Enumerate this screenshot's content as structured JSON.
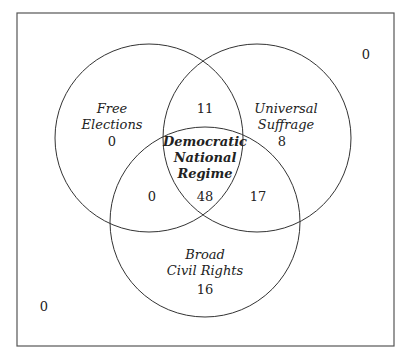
{
  "diagram": {
    "type": "venn",
    "sets": [
      {
        "name": "Free Elections",
        "only": "0"
      },
      {
        "name": "Universal Suffrage",
        "only": "8"
      },
      {
        "name": "Broad Civil Rights",
        "only": "16"
      }
    ],
    "labels": {
      "free_elections_1": "Free",
      "free_elections_2": "Elections",
      "universal_suffrage_1": "Universal",
      "universal_suffrage_2": "Suffrage",
      "broad_civil_rights_1": "Broad",
      "broad_civil_rights_2": "Civil Rights",
      "center_1": "Democratic",
      "center_2": "National",
      "center_3": "Regime"
    },
    "counts": {
      "free_elections_only": "0",
      "universal_suffrage_only": "8",
      "broad_civil_rights_only": "16",
      "fe_and_us": "11",
      "fe_and_bcr": "0",
      "us_and_bcr": "17",
      "all_three": "48",
      "outside_top_right": "0",
      "outside_bottom_left": "0"
    },
    "colors": {
      "stroke": "#333333",
      "background": "#ffffff"
    }
  }
}
